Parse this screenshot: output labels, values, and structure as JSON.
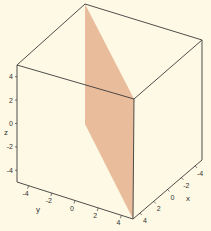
{
  "chart_data": {
    "type": "surface3d",
    "title": "",
    "plane": {
      "color": "#e8b898",
      "vertices_xyz": [
        [
          -5,
          -5,
          5
        ],
        [
          5,
          5,
          5
        ],
        [
          5,
          5,
          -5
        ],
        [
          -5,
          -5,
          -5
        ]
      ]
    },
    "axes": {
      "x": {
        "label": "x",
        "range": [
          -5,
          5
        ],
        "ticks": [
          -4,
          -2,
          0,
          2,
          4
        ],
        "tick_labels": [
          "-4",
          "-2",
          "0",
          "2",
          "4"
        ]
      },
      "y": {
        "label": "y",
        "range": [
          -5,
          5
        ],
        "ticks": [
          -4,
          -2,
          0,
          2,
          4
        ],
        "tick_labels": [
          "-4",
          "-2",
          "0",
          "2",
          "4"
        ]
      },
      "z": {
        "label": "z",
        "range": [
          -5,
          5
        ],
        "ticks": [
          -4,
          -2,
          0,
          2,
          4
        ],
        "tick_labels": [
          "4",
          "2",
          "0",
          "-2",
          "-4"
        ]
      }
    },
    "box": true,
    "background": "#fdf9e4",
    "edge_color": "#3a3a3a"
  }
}
